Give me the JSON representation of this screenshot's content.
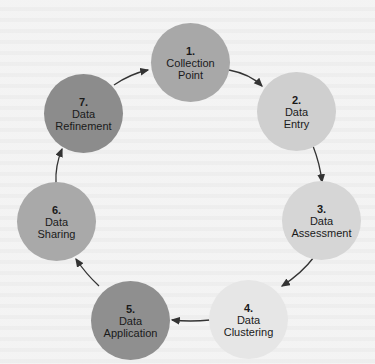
{
  "diagram": {
    "type": "cycle",
    "nodes": [
      {
        "id": 1,
        "num": "1.",
        "line1": "Collection",
        "line2": "Point",
        "color": "#a8a8a8"
      },
      {
        "id": 2,
        "num": "2.",
        "line1": "Data",
        "line2": "Entry",
        "color": "#cfcfcf"
      },
      {
        "id": 3,
        "num": "3.",
        "line1": "Data",
        "line2": "Assessment",
        "color": "#d6d6d6"
      },
      {
        "id": 4,
        "num": "4.",
        "line1": "Data",
        "line2": "Clustering",
        "color": "#e6e6e6"
      },
      {
        "id": 5,
        "num": "5.",
        "line1": "Data",
        "line2": "Application",
        "color": "#8f8f8f"
      },
      {
        "id": 6,
        "num": "6.",
        "line1": "Data",
        "line2": "Sharing",
        "color": "#a9a9a9"
      },
      {
        "id": 7,
        "num": "7.",
        "line1": "Data",
        "line2": "Refinement",
        "color": "#8c8c8c"
      }
    ],
    "edges": [
      {
        "from": 1,
        "to": 2
      },
      {
        "from": 2,
        "to": 3
      },
      {
        "from": 3,
        "to": 4
      },
      {
        "from": 4,
        "to": 5
      },
      {
        "from": 5,
        "to": 6
      },
      {
        "from": 6,
        "to": 7
      },
      {
        "from": 7,
        "to": 1
      }
    ]
  }
}
